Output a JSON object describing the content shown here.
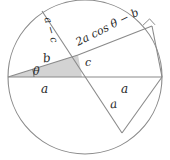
{
  "figure": {
    "background_color": "#ffffff",
    "stroke_color": "#808080",
    "shade_color": "#d3d3d3",
    "text_color": "#2b2b2b"
  },
  "labels": {
    "a_left": "a",
    "a_right": "a",
    "a_lower": "a",
    "b": "b",
    "c": "c",
    "a_minus_c": "a − c",
    "expression": "2a cos θ − b",
    "theta": "θ"
  },
  "geometry": {
    "circle": {
      "cx": 85,
      "cy": 77,
      "r": 77
    },
    "diameter": {
      "x1": 8,
      "y1": 77,
      "x2": 162,
      "y2": 77
    },
    "transversal_chord": {
      "x1": 42,
      "y1": 11,
      "x2": 122,
      "y2": 133
    },
    "hypotenuse_chord": {
      "x1": 78,
      "y1": 55,
      "x2": 152,
      "y2": 26
    },
    "right_leg_chord": {
      "x1": 152,
      "y1": 26,
      "x2": 162,
      "y2": 77
    },
    "lower_right_chord": {
      "x1": 162,
      "y1": 77,
      "x2": 122,
      "y2": 133
    },
    "triangle_b": {
      "x1": 8,
      "y1": 77,
      "x2": 78,
      "y2": 55
    },
    "segment_c": {
      "x1": 78,
      "y1": 55,
      "x2": 82,
      "y2": 77
    },
    "shaded_triangle_points": "8,77 78,55 82,77",
    "right_angle_marker": {
      "x": 145,
      "y": 29,
      "size": 8
    },
    "theta_arc": {
      "cx": 8,
      "cy": 77,
      "r": 26
    }
  }
}
